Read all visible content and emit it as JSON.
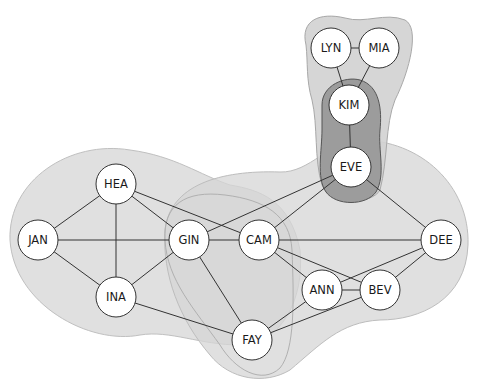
{
  "diagram": {
    "type": "network-graph-with-community-overlaps",
    "colors": {
      "background": "#ffffff",
      "region_light": "#dadada",
      "region_light_stroke": "#b8b8b8",
      "region_dark": "#9a9a9a",
      "region_dark_stroke": "#555555",
      "node_fill": "#ffffff",
      "node_stroke": "#333333",
      "edge": "#333333",
      "label": "#1a1a1a"
    },
    "node_radius": 20,
    "nodes": [
      {
        "id": "LYN",
        "label": "LYN",
        "x": 331,
        "y": 48
      },
      {
        "id": "MIA",
        "label": "MIA",
        "x": 379,
        "y": 48
      },
      {
        "id": "KIM",
        "label": "KIM",
        "x": 349,
        "y": 105
      },
      {
        "id": "EVE",
        "label": "EVE",
        "x": 351,
        "y": 167
      },
      {
        "id": "HEA",
        "label": "HEA",
        "x": 116,
        "y": 184
      },
      {
        "id": "JAN",
        "label": "JAN",
        "x": 38,
        "y": 240
      },
      {
        "id": "GIN",
        "label": "GIN",
        "x": 189,
        "y": 240
      },
      {
        "id": "CAM",
        "label": "CAM",
        "x": 259,
        "y": 240
      },
      {
        "id": "DEE",
        "label": "DEE",
        "x": 441,
        "y": 240
      },
      {
        "id": "INA",
        "label": "INA",
        "x": 116,
        "y": 297
      },
      {
        "id": "ANN",
        "label": "ANN",
        "x": 322,
        "y": 290
      },
      {
        "id": "BEV",
        "label": "BEV",
        "x": 380,
        "y": 290
      },
      {
        "id": "FAY",
        "label": "FAY",
        "x": 252,
        "y": 340
      }
    ],
    "edges": [
      [
        "LYN",
        "MIA"
      ],
      [
        "LYN",
        "KIM"
      ],
      [
        "MIA",
        "KIM"
      ],
      [
        "KIM",
        "EVE"
      ],
      [
        "EVE",
        "GIN"
      ],
      [
        "EVE",
        "CAM"
      ],
      [
        "EVE",
        "DEE"
      ],
      [
        "HEA",
        "JAN"
      ],
      [
        "HEA",
        "INA"
      ],
      [
        "HEA",
        "GIN"
      ],
      [
        "HEA",
        "CAM"
      ],
      [
        "JAN",
        "GIN"
      ],
      [
        "JAN",
        "INA"
      ],
      [
        "INA",
        "GIN"
      ],
      [
        "INA",
        "FAY"
      ],
      [
        "GIN",
        "CAM"
      ],
      [
        "GIN",
        "FAY"
      ],
      [
        "CAM",
        "DEE"
      ],
      [
        "CAM",
        "ANN"
      ],
      [
        "CAM",
        "BEV"
      ],
      [
        "ANN",
        "BEV"
      ],
      [
        "ANN",
        "DEE"
      ],
      [
        "ANN",
        "FAY"
      ],
      [
        "BEV",
        "DEE"
      ],
      [
        "BEV",
        "FAY"
      ]
    ],
    "groups": [
      {
        "id": "group-left",
        "members": [
          "HEA",
          "JAN",
          "GIN",
          "INA",
          "CAM",
          "FAY"
        ]
      },
      {
        "id": "group-right",
        "members": [
          "EVE",
          "GIN",
          "CAM",
          "DEE",
          "ANN",
          "BEV",
          "FAY"
        ]
      },
      {
        "id": "group-top",
        "members": [
          "LYN",
          "MIA",
          "KIM",
          "EVE"
        ]
      },
      {
        "id": "group-middle-overlap",
        "members": [
          "GIN",
          "CAM",
          "FAY"
        ]
      },
      {
        "id": "group-bridge",
        "members": [
          "KIM",
          "EVE"
        ]
      }
    ]
  }
}
